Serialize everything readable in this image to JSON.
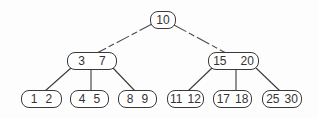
{
  "diagram": {
    "type": "b-tree",
    "root": {
      "keys": [
        "10"
      ]
    },
    "internal": [
      {
        "keys": [
          "3",
          "7"
        ]
      },
      {
        "keys": [
          "15",
          "20"
        ]
      }
    ],
    "leaves": [
      {
        "keys": [
          "1",
          "2"
        ]
      },
      {
        "keys": [
          "4",
          "5"
        ]
      },
      {
        "keys": [
          "8",
          "9"
        ]
      },
      {
        "keys": [
          "11",
          "12"
        ]
      },
      {
        "keys": [
          "17",
          "18"
        ]
      },
      {
        "keys": [
          "25",
          "30"
        ]
      }
    ],
    "edges": [
      {
        "from": "10",
        "to": "3 7"
      },
      {
        "from": "10",
        "to": "15 20"
      },
      {
        "from": "3 7",
        "to": "1 2"
      },
      {
        "from": "3 7",
        "to": "4 5"
      },
      {
        "from": "3 7",
        "to": "8 9"
      },
      {
        "from": "15 20",
        "to": "11 12"
      },
      {
        "from": "15 20",
        "to": "17 18"
      },
      {
        "from": "15 20",
        "to": "25 30"
      }
    ],
    "colors": {
      "line": "#3a3a3a",
      "text": "#333333",
      "background": "#fdfdfd"
    }
  }
}
